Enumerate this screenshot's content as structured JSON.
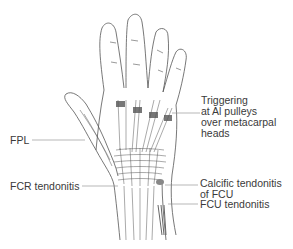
{
  "diagram": {
    "labels": [
      {
        "id": "trigger",
        "text": "Triggering\nat Al pulleys\nover metacarpal\nheads"
      },
      {
        "id": "fpl",
        "text": "FPL"
      },
      {
        "id": "fcr",
        "text": "FCR tendonitis"
      },
      {
        "id": "calcific",
        "text": "Calcific tendonitis\nof FCU"
      },
      {
        "id": "fcu",
        "text": "FCU tendonitis"
      }
    ],
    "colors": {
      "line": "#555555",
      "shade": "#666666",
      "text": "#3a3a3a"
    }
  }
}
